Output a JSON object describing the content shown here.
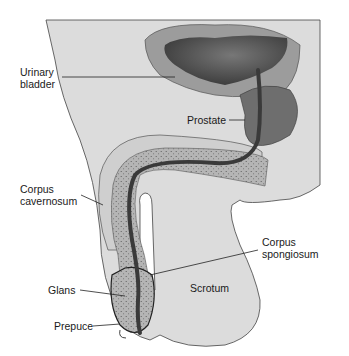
{
  "diagram": {
    "type": "anatomical-illustration",
    "labels": {
      "urinary_bladder_line1": "Urinary",
      "urinary_bladder_line2": "bladder",
      "prostate": "Prostate",
      "corpus_cavernosum_line1": "Corpus",
      "corpus_cavernosum_line2": "cavernosum",
      "corpus_spongiosum_line1": "Corpus",
      "corpus_spongiosum_line2": "spongiosum",
      "glans": "Glans",
      "scrotum": "Scrotum",
      "prepuce": "Prepuce"
    },
    "colors": {
      "body": "#d9d9d9",
      "bladder_outer": "#9a9a9a",
      "bladder_inner": "#4a4a4a",
      "prostate": "#6e6e6e",
      "urethra": "#3c3c3c",
      "spongiosum": "#a8a8a8",
      "cavernosum": "#c8c8c8",
      "outline": "#333333"
    }
  }
}
